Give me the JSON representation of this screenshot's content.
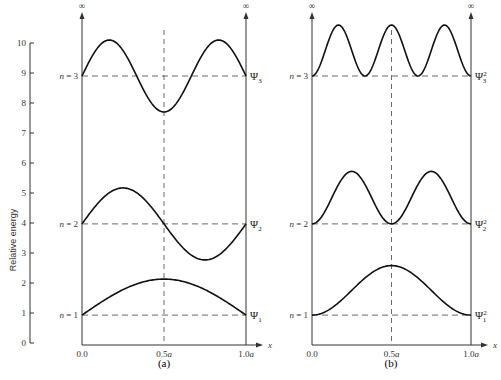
{
  "chart_data": [
    {
      "type": "line",
      "panel": "(a)",
      "title": "Wave functions Ψn for particle in a 1-D box",
      "xlabel": "x",
      "ylabel": "Relative energy",
      "x_ticks": [
        "0.0",
        "0.5a",
        "1.0a"
      ],
      "y_ticks": [
        "0",
        "1",
        "2",
        "3",
        "4",
        "5",
        "6",
        "7",
        "8",
        "9",
        "10"
      ],
      "ylim": [
        0,
        10
      ],
      "wall_labels": [
        "∞",
        "∞"
      ],
      "levels": [
        {
          "label": "n = 1",
          "energy": 0.93,
          "curve": "Ψ1",
          "amplitude": 1.2,
          "halfwaves": 1
        },
        {
          "label": "n = 2",
          "energy": 3.97,
          "curve": "Ψ2",
          "amplitude": 1.2,
          "halfwaves": 2
        },
        {
          "label": "n = 3",
          "energy": 8.9,
          "curve": "Ψ3",
          "amplitude": 1.2,
          "halfwaves": 3
        }
      ],
      "midline": "0.5a dashed vertical",
      "grid": false
    },
    {
      "type": "line",
      "panel": "(b)",
      "title": "Probability densities Ψn² for particle in a 1-D box",
      "xlabel": "x",
      "x_ticks": [
        "0.0",
        "0.5a",
        "1.0a"
      ],
      "wall_labels": [
        "∞",
        "∞"
      ],
      "levels": [
        {
          "label": "n = 1",
          "energy": 0.93,
          "curve": "Ψ1²",
          "amplitude": 1.65,
          "halfwaves": 1
        },
        {
          "label": "n = 2",
          "energy": 3.97,
          "curve": "Ψ2²",
          "amplitude": 1.75,
          "halfwaves": 2
        },
        {
          "label": "n = 3",
          "energy": 8.9,
          "curve": "Ψ3²",
          "amplitude": 1.7,
          "halfwaves": 3
        }
      ],
      "midline": "0.5a dashed vertical",
      "grid": false
    }
  ],
  "yaxis": {
    "label": "Relative energy",
    "ticks": [
      "0",
      "1",
      "2",
      "3",
      "4",
      "5",
      "6",
      "7",
      "8",
      "9",
      "10"
    ]
  },
  "panel_a": {
    "label": "(a)",
    "wall_left": "∞",
    "wall_right": "∞",
    "x_axis": "x",
    "x_ticks": [
      "0.0",
      "0.5a",
      "1.0a"
    ],
    "levels": [
      "n = 1",
      "n = 2",
      "n = 3"
    ],
    "curves": [
      {
        "psi": "Ψ",
        "sub": "1",
        "sup": ""
      },
      {
        "psi": "Ψ",
        "sub": "2",
        "sup": ""
      },
      {
        "psi": "Ψ",
        "sub": "3",
        "sup": ""
      }
    ]
  },
  "panel_b": {
    "label": "(b)",
    "wall_left": "∞",
    "wall_right": "∞",
    "x_axis": "x",
    "x_ticks": [
      "0.0",
      "0.5a",
      "1.0a"
    ],
    "levels": [
      "n = 1",
      "n = 2",
      "n = 3"
    ],
    "curves": [
      {
        "psi": "Ψ",
        "sub": "1",
        "sup": "2"
      },
      {
        "psi": "Ψ",
        "sub": "2",
        "sup": "2"
      },
      {
        "psi": "Ψ",
        "sub": "3",
        "sup": "2"
      }
    ]
  },
  "caption": "Fig. 2.1  Particle in a box"
}
